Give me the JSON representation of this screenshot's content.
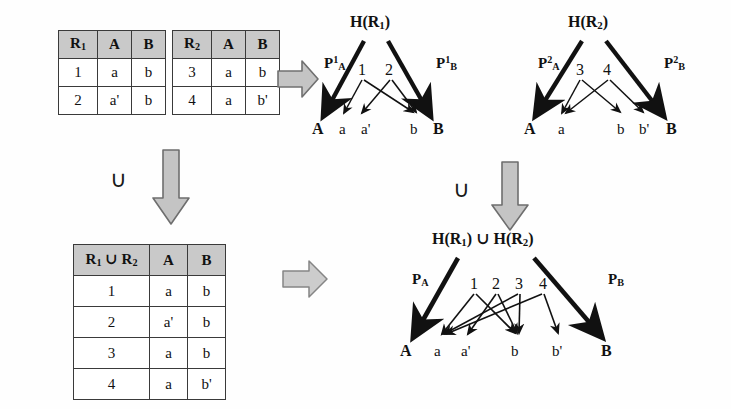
{
  "figure": {
    "background_color": "#ffffff",
    "ink_color": "#111111",
    "header_fill": "#c9c9c9",
    "block_arrow_fill": "#bfbfbf",
    "block_arrow_stroke": "#6e6e6e"
  },
  "tables": {
    "r1": {
      "name": "R1",
      "headers": [
        "R₁",
        "A",
        "B"
      ],
      "rows": [
        [
          "1",
          "a",
          "b"
        ],
        [
          "2",
          "a'",
          "b"
        ]
      ]
    },
    "r2": {
      "name": "R2",
      "headers": [
        "R₂",
        "A",
        "B"
      ],
      "rows": [
        [
          "3",
          "a",
          "b"
        ],
        [
          "4",
          "a",
          "b'"
        ]
      ]
    },
    "union": {
      "name": "R1 union R2",
      "headers": [
        "R₁ ∪ R₂",
        "A",
        "B"
      ],
      "rows": [
        [
          "1",
          "a",
          "b"
        ],
        [
          "2",
          "a'",
          "b"
        ],
        [
          "3",
          "a",
          "b"
        ],
        [
          "4",
          "a",
          "b'"
        ]
      ]
    }
  },
  "operators": {
    "union_symbol": "∪",
    "left_union_label": "∪",
    "right_union_label": "∪"
  },
  "graphs": {
    "h_r1": {
      "title": "H(R₁)",
      "port_left": "P¹ₐ",
      "port_left_base": "P",
      "port_left_sup": "1",
      "port_left_sub": "A",
      "port_right_base": "P",
      "port_right_sup": "1",
      "port_right_sub": "B",
      "terminal_left": "A",
      "terminal_right": "B",
      "tuple_nodes": [
        "1",
        "2"
      ],
      "value_nodes": [
        "a",
        "a'",
        "b"
      ],
      "edges": [
        {
          "from": "1",
          "to": "a"
        },
        {
          "from": "1",
          "to": "b"
        },
        {
          "from": "2",
          "to": "a'"
        },
        {
          "from": "2",
          "to": "b"
        }
      ]
    },
    "h_r2": {
      "title": "H(R₂)",
      "port_left_base": "P",
      "port_left_sup": "2",
      "port_left_sub": "A",
      "port_right_base": "P",
      "port_right_sup": "2",
      "port_right_sub": "B",
      "terminal_left": "A",
      "terminal_right": "B",
      "tuple_nodes": [
        "3",
        "4"
      ],
      "value_nodes": [
        "a",
        "b",
        "b'"
      ],
      "edges": [
        {
          "from": "3",
          "to": "a"
        },
        {
          "from": "3",
          "to": "b"
        },
        {
          "from": "4",
          "to": "a"
        },
        {
          "from": "4",
          "to": "b'"
        }
      ]
    },
    "h_union": {
      "title_part1": "H(R₁)",
      "title_union": "∪",
      "title_part2": "H(R₂)",
      "port_left_base": "P",
      "port_left_sub": "A",
      "port_right_base": "P",
      "port_right_sub": "B",
      "terminal_left": "A",
      "terminal_right": "B",
      "tuple_nodes": [
        "1",
        "2",
        "3",
        "4"
      ],
      "value_nodes": [
        "a",
        "a'",
        "b",
        "b'"
      ],
      "edges": [
        {
          "from": "1",
          "to": "a"
        },
        {
          "from": "1",
          "to": "b"
        },
        {
          "from": "2",
          "to": "a'"
        },
        {
          "from": "2",
          "to": "b"
        },
        {
          "from": "3",
          "to": "a"
        },
        {
          "from": "3",
          "to": "b"
        },
        {
          "from": "4",
          "to": "a"
        },
        {
          "from": "4",
          "to": "b'"
        }
      ]
    }
  }
}
